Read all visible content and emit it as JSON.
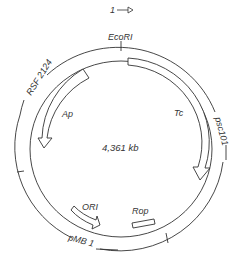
{
  "diagram": {
    "type": "plasmid-map",
    "direction_label": "1",
    "size_label": "4,361 kb",
    "sites": [
      {
        "name": "EcoRI",
        "position": "top"
      }
    ],
    "origin_segments": [
      {
        "name": "RSF 2124",
        "position": "upper-left"
      },
      {
        "name": "psc101",
        "position": "right"
      },
      {
        "name": "pMB 1",
        "position": "bottom"
      }
    ],
    "genes": [
      {
        "name": "Ap",
        "direction": "counterclockwise"
      },
      {
        "name": "Tc",
        "direction": "clockwise"
      },
      {
        "name": "ORI",
        "direction": "clockwise"
      },
      {
        "name": "Rop",
        "direction": "none"
      }
    ]
  }
}
